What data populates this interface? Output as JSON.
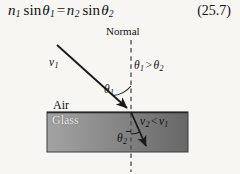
{
  "figure": {
    "type": "physics-diagram",
    "background_color": "#f7f6f3",
    "width": 240,
    "height": 174
  },
  "equation": {
    "number": "(25.7)",
    "plain_text": "n1 sin O1 = n2 sin O2",
    "parts": {
      "n_left": "n",
      "n_left_sub": "1",
      "sin_left": "sin",
      "theta_left": "θ",
      "theta_left_sub": "1",
      "equals": "=",
      "n_right": "n",
      "n_right_sub": "2",
      "sin_right": "sin",
      "theta_right": "θ",
      "theta_right_sub": "2"
    }
  },
  "labels": {
    "normal": "Normal",
    "air": "Air",
    "glass": "Glass",
    "incident_speed": "v",
    "incident_speed_sub": "1",
    "theta1": "θ",
    "theta1_sub": "1",
    "theta2": "θ",
    "theta2_sub": "2",
    "angle_inequality": {
      "left": "θ",
      "left_sub": "1",
      "operator": ">",
      "right": "θ",
      "right_sub": "2",
      "plain_text": "O1 > O2"
    },
    "speed_inequality": {
      "left": "v",
      "left_sub": "2",
      "operator": "<",
      "right": "v",
      "right_sub": "1",
      "plain_text": "v2 < v1"
    }
  },
  "geometry": {
    "normal_line": {
      "x": 131,
      "y_top": 40,
      "y_bottom": 172,
      "style": "dashed"
    },
    "interface_y": 112,
    "glass_block": {
      "x": 47,
      "y": 112,
      "width": 141,
      "height": 40
    },
    "incident_ray": {
      "x1": 57,
      "y1": 45,
      "x2": 131,
      "y2": 112
    },
    "refracted_ray": {
      "x1": 131,
      "y1": 112,
      "x2": 149,
      "y2": 151
    },
    "theta1_arc_radius": 26,
    "theta2_arc_radius": 22
  },
  "colors": {
    "ink": "#111111",
    "glass_light": "#9c9c9c",
    "glass_dark": "#6a6a6a",
    "glass_border": "#3a3a3a",
    "glass_text": "#f2f2f2",
    "interface_line": "#2b2b2b",
    "dash_line": "#4a4a4a"
  }
}
